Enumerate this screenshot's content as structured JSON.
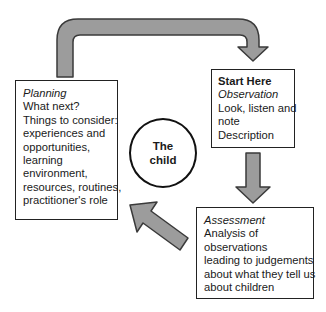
{
  "diagram": {
    "type": "cycle",
    "center": {
      "lines": [
        "The",
        "child"
      ]
    },
    "nodes": {
      "planning": {
        "title": "Planning",
        "lines": [
          "What next?",
          "Things to consider:",
          "experiences and",
          "opportunities,",
          "learning",
          "environment,",
          "resources, routines,",
          "practitioner's role"
        ]
      },
      "observation": {
        "heading": "Start Here",
        "title": "Observation",
        "lines": [
          "Look, listen and",
          "note",
          "Description"
        ]
      },
      "assessment": {
        "title": "Assessment",
        "lines": [
          "Analysis of",
          "observations",
          "leading to judgements",
          "about what they tell us",
          "about children"
        ]
      }
    },
    "edges": [
      {
        "from": "planning",
        "to": "observation",
        "style": "curved-block-arrow"
      },
      {
        "from": "observation",
        "to": "assessment",
        "style": "down-block-arrow"
      },
      {
        "from": "assessment",
        "to": "planning",
        "style": "diagonal-block-arrow"
      }
    ],
    "colors": {
      "arrow_fill": "#9c9c9c",
      "arrow_stroke": "#3a3a3a",
      "box_border": "#222222",
      "text": "#1a1a1a"
    }
  }
}
